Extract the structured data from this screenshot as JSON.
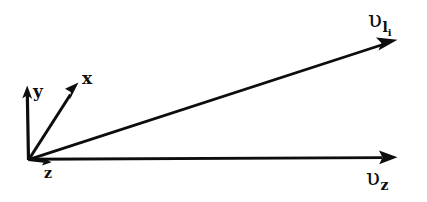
{
  "figure": {
    "kind": "vector-diagram",
    "background_color": "#ffffff",
    "stroke_color": "#0d0d0d",
    "width": 427,
    "height": 202,
    "origin": {
      "x": 28,
      "y": 160
    },
    "axes": [
      {
        "id": "y",
        "label": "y",
        "from": {
          "x": 28,
          "y": 160
        },
        "to": {
          "x": 27,
          "y": 86
        },
        "label_position": {
          "x": 33,
          "y": 83
        }
      },
      {
        "id": "x",
        "label": "x",
        "from": {
          "x": 28,
          "y": 160
        },
        "to": {
          "x": 78,
          "y": 83
        },
        "label_position": {
          "x": 82,
          "y": 70
        }
      },
      {
        "id": "z",
        "label": "z",
        "from": {
          "x": 28,
          "y": 160
        },
        "to": {
          "x": 50,
          "y": 162
        },
        "label_position": {
          "x": 44,
          "y": 166
        }
      }
    ],
    "vectors": [
      {
        "id": "v-li",
        "glyph": "υ",
        "subscript": "l",
        "subsubscript": "i",
        "label_text": "υlᵢ",
        "from": {
          "x": 28,
          "y": 160
        },
        "to": {
          "x": 397,
          "y": 40
        },
        "label_position": {
          "x": 368,
          "y": 8
        }
      },
      {
        "id": "v-z",
        "glyph": "υ",
        "subscript": "z",
        "subsubscript": "",
        "label_text": "υz",
        "from": {
          "x": 28,
          "y": 159
        },
        "to": {
          "x": 397,
          "y": 157
        },
        "label_position": {
          "x": 366,
          "y": 166
        }
      }
    ]
  }
}
